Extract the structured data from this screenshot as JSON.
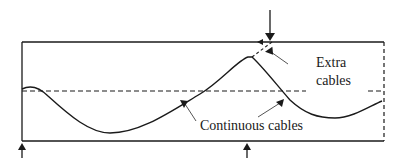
{
  "diagram": {
    "labels": {
      "extra_line1": "Extra",
      "extra_line2": "cables",
      "continuous": "Continuous cables"
    },
    "elements": {
      "frame": "rectangular box with solid left, top, bottom edges and dashed right edge",
      "midline": "dashed horizontal centerline",
      "continuous_cable": "solid wavy curve",
      "extra_cable": "dashed extension near top peak",
      "load_arrows": [
        "down arrow at top near peak",
        "up arrow at bottom-left support",
        "up arrow at bottom-middle support"
      ]
    },
    "colors": {
      "stroke": "#1a1a1a",
      "leader": "#555555",
      "background": "#ffffff"
    }
  }
}
